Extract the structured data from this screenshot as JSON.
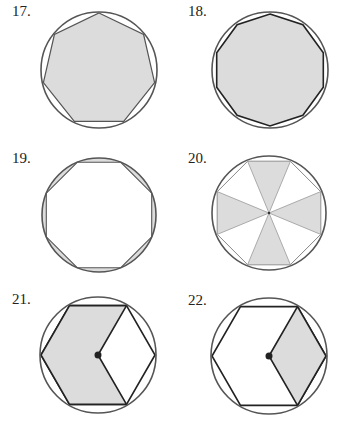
{
  "figures": [
    {
      "number": "17.",
      "shape": "heptagon",
      "description": "Regular heptagon inscribed in circle, heptagon shaded",
      "center": [
        99,
        70
      ],
      "radius": 57,
      "sides": 7,
      "shaded": "polygon"
    },
    {
      "number": "18.",
      "shape": "decagon",
      "description": "Regular decagon inscribed in circle, decagon shaded",
      "center": [
        270,
        70
      ],
      "radius": 57,
      "sides": 10,
      "shaded": "polygon"
    },
    {
      "number": "19.",
      "shape": "octagon",
      "description": "Regular octagon inscribed in circle, circular segments shaded",
      "center": [
        99,
        215
      ],
      "radius": 57,
      "sides": 8,
      "shaded": "segments"
    },
    {
      "number": "20.",
      "shape": "octagon",
      "description": "Regular octagon inscribed in circle with alternating triangles shaded",
      "center": [
        269,
        213
      ],
      "radius": 56,
      "sides": 8,
      "shaded": "alternate-triangles"
    },
    {
      "number": "21.",
      "shape": "hexagon",
      "description": "Regular hexagon inscribed in circle, 4 of 6 triangles shaded (concave region)",
      "center": [
        98,
        355
      ],
      "radius": 57,
      "sides": 6,
      "shaded": "four-triangles"
    },
    {
      "number": "22.",
      "shape": "hexagon",
      "description": "Regular hexagon inscribed in circle, 2 of 6 triangles shaded (rhombus)",
      "center": [
        269,
        356
      ],
      "radius": 57,
      "sides": 6,
      "shaded": "two-triangles"
    }
  ],
  "colors": {
    "shade": "#dcdcdc",
    "stroke": "#333333",
    "circle": "#555555"
  }
}
